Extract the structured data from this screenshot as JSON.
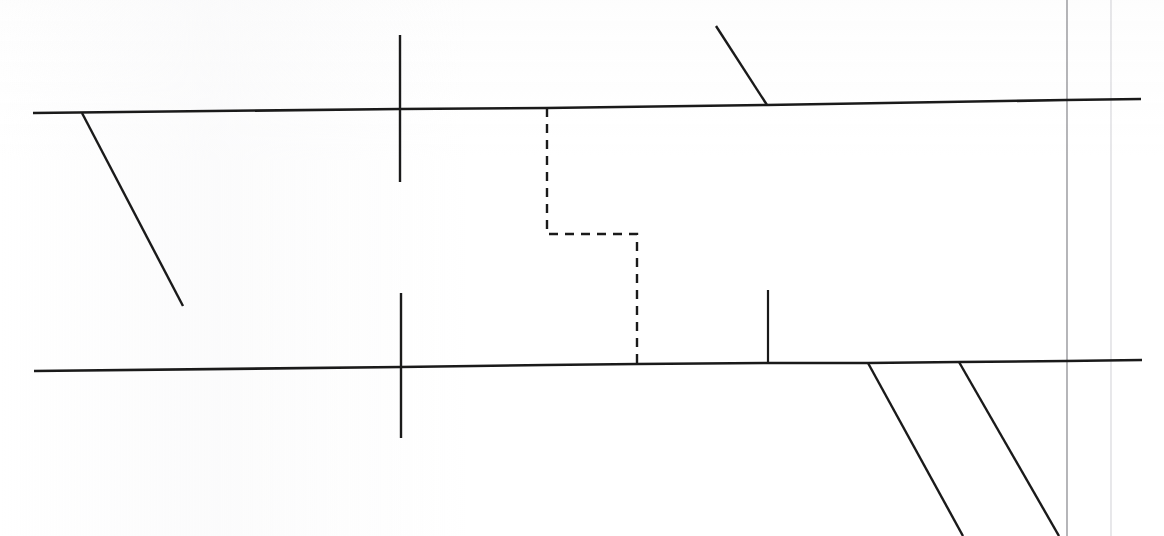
{
  "document": {
    "title": "Scanned technical line drawing",
    "background_color": "#ffffff",
    "width": 1164,
    "height": 536,
    "ink_color": "#1a1a1a",
    "guide_color": "#8e8e93",
    "faint_guide_color": "#dedee1"
  },
  "strokes": {
    "upper_boundary": {
      "label": "upper horizontal boundary line",
      "type": "solid",
      "color": "#1a1a1a",
      "width": 2.6,
      "points": "33,113 400,109 546,108 767,105 1066,100 1141,99"
    },
    "lower_boundary": {
      "label": "lower horizontal boundary line",
      "type": "solid",
      "color": "#1a1a1a",
      "width": 2.6,
      "points": "34,371 401,367 546,365 637,364 768,363 868,363 959,362 1066,361 1142,360"
    },
    "left_diagonal": {
      "label": "left descending branch line",
      "type": "solid",
      "color": "#1a1a1a",
      "width": 2.4,
      "points": "82,113 183,306"
    },
    "upper_right_diagonal": {
      "label": "upper right ascending branch line",
      "type": "solid",
      "color": "#1a1a1a",
      "width": 2.4,
      "points": "716,26 767,105"
    },
    "upper_cross_tick": {
      "label": "upper vertical cross tick",
      "type": "solid",
      "color": "#1a1a1a",
      "width": 2.4,
      "points": "400,35 400,182"
    },
    "lower_cross_tick": {
      "label": "lower vertical cross tick",
      "type": "solid",
      "color": "#1a1a1a",
      "width": 2.4,
      "points": "401,293 401,438"
    },
    "short_vertical_tick": {
      "label": "short vertical tick above lower boundary",
      "type": "solid",
      "color": "#1a1a1a",
      "width": 2.2,
      "points": "768,290 768,363"
    },
    "dashed_connector": {
      "label": "dashed stepped connector between boundaries",
      "type": "dashed",
      "color": "#1a1a1a",
      "width": 2.4,
      "dash": "9 7",
      "points": "547,108 547,234 637,234 637,364"
    },
    "bottom_diagonal_a": {
      "label": "bottom left descending diagonal",
      "type": "solid",
      "color": "#1a1a1a",
      "width": 2.4,
      "points": "868,363 963,536"
    },
    "bottom_diagonal_b": {
      "label": "bottom right descending diagonal",
      "type": "solid",
      "color": "#1a1a1a",
      "width": 2.4,
      "points": "959,362 1059,536"
    },
    "right_guide_line": {
      "label": "right vertical guide line",
      "type": "solid",
      "color": "#8e8e93",
      "width": 1.3,
      "points": "1067,0 1067,536"
    },
    "right_faint_guide_line": {
      "label": "right faint vertical guide line",
      "type": "solid",
      "color": "#e2e2e5",
      "width": 1.6,
      "points": "1111,0 1111,536"
    }
  },
  "stroke_order": [
    "right_faint_guide_line",
    "right_guide_line",
    "upper_boundary",
    "lower_boundary",
    "left_diagonal",
    "upper_right_diagonal",
    "upper_cross_tick",
    "lower_cross_tick",
    "short_vertical_tick",
    "bottom_diagonal_a",
    "bottom_diagonal_b",
    "dashed_connector"
  ]
}
